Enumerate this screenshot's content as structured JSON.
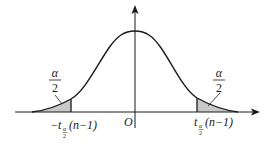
{
  "diagram": {
    "type": "t-distribution-density",
    "origin_label": "O",
    "left_tail": {
      "area_label_numerator": "α",
      "area_label_denominator": "2",
      "critical_value": {
        "sign": "−",
        "symbol": "t",
        "subscript_num": "α",
        "subscript_den": "2",
        "argument": "(n−1)"
      }
    },
    "right_tail": {
      "area_label_numerator": "α",
      "area_label_denominator": "2",
      "critical_value": {
        "symbol": "t",
        "subscript_num": "α",
        "subscript_den": "2",
        "argument": "(n−1)"
      }
    },
    "colors": {
      "curve": "#1a1a1a",
      "shade": "#c8c8c8",
      "axes": "#1a1a1a"
    }
  }
}
